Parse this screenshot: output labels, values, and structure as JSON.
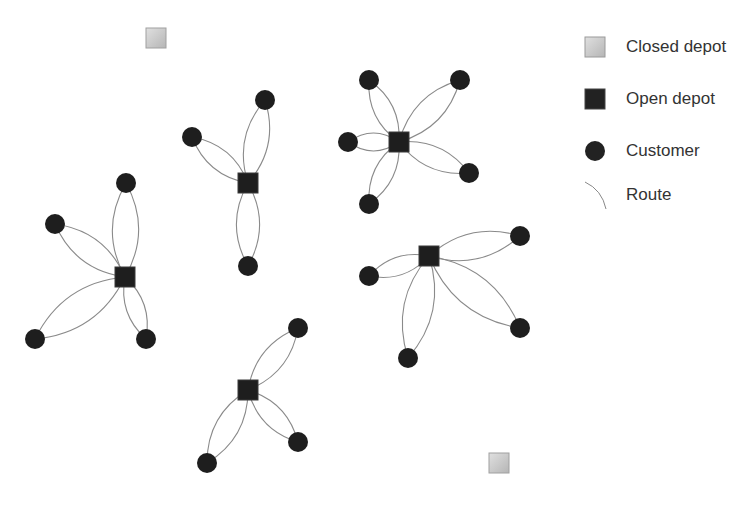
{
  "legend": {
    "items": [
      {
        "key": "closed_depot",
        "label": "Closed depot",
        "color": "#c8c8c8"
      },
      {
        "key": "open_depot",
        "label": "Open depot",
        "color": "#222222"
      },
      {
        "key": "customer",
        "label": "Customer",
        "color": "#222222"
      },
      {
        "key": "route",
        "label": "Route",
        "color": "#888888"
      }
    ]
  },
  "diagram": {
    "closed_depots": [
      {
        "id": "closed-depot-1",
        "x": 156,
        "y": 38
      },
      {
        "id": "closed-depot-2",
        "x": 499,
        "y": 463
      }
    ],
    "clusters": [
      {
        "id": "cluster-a",
        "depot": {
          "x": 125,
          "y": 277
        },
        "customers": [
          {
            "x": 126,
            "y": 183
          },
          {
            "x": 55,
            "y": 224
          },
          {
            "x": 35,
            "y": 339
          },
          {
            "x": 146,
            "y": 339
          }
        ]
      },
      {
        "id": "cluster-b",
        "depot": {
          "x": 248,
          "y": 183
        },
        "customers": [
          {
            "x": 265,
            "y": 100
          },
          {
            "x": 192,
            "y": 137
          },
          {
            "x": 248,
            "y": 266
          }
        ]
      },
      {
        "id": "cluster-c",
        "depot": {
          "x": 399,
          "y": 142
        },
        "customers": [
          {
            "x": 369,
            "y": 80
          },
          {
            "x": 460,
            "y": 80
          },
          {
            "x": 348,
            "y": 142
          },
          {
            "x": 469,
            "y": 173
          },
          {
            "x": 369,
            "y": 204
          }
        ]
      },
      {
        "id": "cluster-d",
        "depot": {
          "x": 429,
          "y": 256
        },
        "customers": [
          {
            "x": 520,
            "y": 236
          },
          {
            "x": 369,
            "y": 276
          },
          {
            "x": 520,
            "y": 328
          },
          {
            "x": 408,
            "y": 358
          }
        ]
      },
      {
        "id": "cluster-e",
        "depot": {
          "x": 248,
          "y": 390
        },
        "customers": [
          {
            "x": 298,
            "y": 328
          },
          {
            "x": 298,
            "y": 442
          },
          {
            "x": 207,
            "y": 463
          }
        ]
      }
    ],
    "style": {
      "depot_size": 20,
      "customer_radius": 10,
      "route_color": "#8a8a8a",
      "node_color": "#1e1e1e"
    }
  }
}
